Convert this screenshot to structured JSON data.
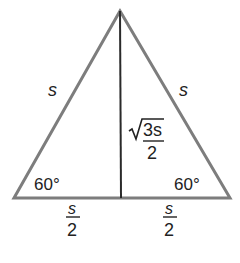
{
  "diagram": {
    "colors": {
      "outline": "#7a7a7a",
      "altitude": "#2a2a2a",
      "text": "#222222"
    },
    "vertices": {
      "apex": [
        120,
        11
      ],
      "left": [
        14,
        198
      ],
      "right": [
        230,
        198
      ],
      "foot": [
        121,
        198
      ]
    },
    "labels": {
      "left_side": "s",
      "right_side": "s",
      "altitude_numerator_radical": "3s",
      "altitude_denominator": "2",
      "left_angle": "60°",
      "right_angle": "60°",
      "left_half_numerator": "s",
      "left_half_denominator": "2",
      "right_half_numerator": "s",
      "right_half_denominator": "2"
    }
  }
}
